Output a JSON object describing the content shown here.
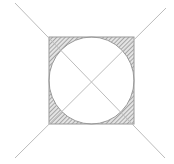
{
  "diagram": {
    "colors": {
      "background": "#ffffff",
      "line": "#bcbcbc",
      "outline": "#9a9a9a",
      "hatch": "#8a8a8a",
      "hatch_bg": "#e4e4e4"
    },
    "square": {
      "x": 49,
      "y": 37,
      "width": 85,
      "height": 87
    },
    "circle": {
      "cx": 91.5,
      "cy": 80.5,
      "rx": 42.5,
      "ry": 43.5
    },
    "diagonals": [
      {
        "x1": 15,
        "y1": 3,
        "x2": 165,
        "y2": 158
      },
      {
        "x1": 166,
        "y1": 8,
        "x2": 15,
        "y2": 158
      }
    ]
  }
}
